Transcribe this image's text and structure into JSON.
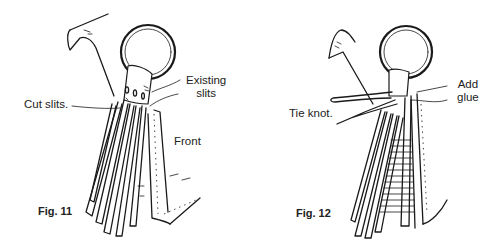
{
  "figures": [
    {
      "id": "fig11",
      "caption": "Fig. 11",
      "labels": {
        "cut_slits": "Cut slits.",
        "existing_slits_line1": "Existing",
        "existing_slits_line2": "slits",
        "front": "Front"
      }
    },
    {
      "id": "fig12",
      "caption": "Fig. 12",
      "labels": {
        "tie_knot": "Tie knot.",
        "add_glue_line1": "Add",
        "add_glue_line2": "glue"
      }
    }
  ],
  "colors": {
    "ink": "#1a1a1a",
    "background": "#ffffff"
  }
}
